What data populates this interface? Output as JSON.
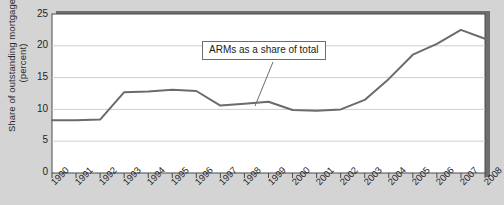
{
  "chart_data": {
    "type": "line",
    "title": "",
    "xlabel": "",
    "ylabel": "Share of outstanding mortgages (percent)",
    "ylim": [
      0,
      25
    ],
    "ytick_values": [
      0,
      5,
      10,
      15,
      20,
      25
    ],
    "ytick_labels": [
      "0",
      "5",
      "10",
      "15",
      "20",
      "25"
    ],
    "grid": true,
    "grid_axis": "y",
    "legend": "none",
    "categories": [
      "1990",
      "1991",
      "1992",
      "1993",
      "1994",
      "1995",
      "1996",
      "1997",
      "1998",
      "1999",
      "2000",
      "2001",
      "2002",
      "2003",
      "2004",
      "2005",
      "2006",
      "2007",
      "2008"
    ],
    "series": [
      {
        "name": "ARMs as a share of total",
        "color": "#6b6b6b",
        "values": [
          8.3,
          8.3,
          8.4,
          12.7,
          12.8,
          13.1,
          12.9,
          10.6,
          10.9,
          11.2,
          9.9,
          9.8,
          10.0,
          11.5,
          14.8,
          18.6,
          20.3,
          22.5,
          21.1
        ]
      }
    ],
    "annotations": [
      {
        "text": "ARMs as a share of total",
        "anchor_x": "1999",
        "anchor_y": 11.2
      }
    ]
  },
  "colors": {
    "background": "#d4d4d4",
    "plot_background": "#ffffff",
    "line": "#6b6b6b",
    "grid": "#cfcfcf",
    "axis": "#4a4a4a",
    "shadow": "#6e6e6e",
    "text": "#1f1f1f"
  }
}
